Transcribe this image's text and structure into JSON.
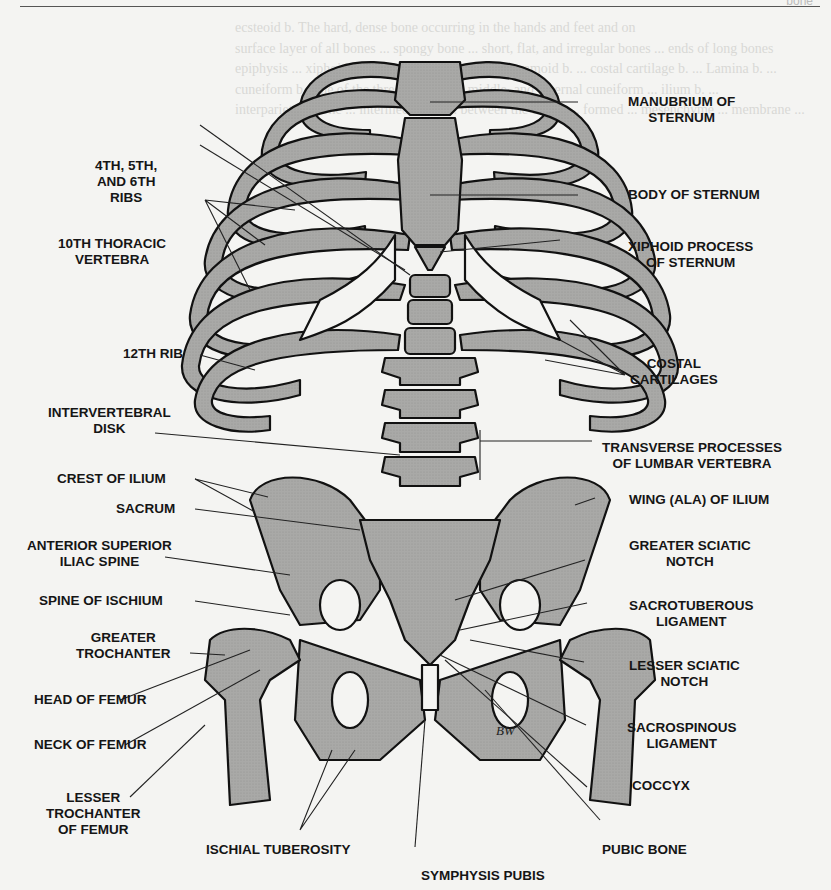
{
  "page": {
    "header_tag": "bone",
    "background_text": "ecsteoid b. The hard, dense bone occurring in the hands and feet and on\nsurface layer of all bones ... spongy bone ... short, flat, and irregular bones ... ends of long bones\nepiphysis ... xiphoid b. ... cuboid b. The outer ... sesamoid b. ... costal cartilage b. ... Lamina b. ...\ncuneiform b. One of the three ... internal, middle, and external cuneiform ... ilium b. ...\ninterparietal b. The ... intermediate b. ... between the center ... formed ... mesenchyme ... membrane ..."
  },
  "diagram": {
    "fill_color": "#a9a9a7",
    "cartilage_color": "#f4f4f2",
    "outline_color": "#111111",
    "signature": "BW",
    "labels_left": [
      {
        "id": "ribs-4-5-6",
        "lines": [
          "4TH, 5TH,",
          "AND 6TH",
          "RIBS"
        ]
      },
      {
        "id": "10th-thoracic-vertebra",
        "lines": [
          "10TH THORACIC",
          "VERTEBRA"
        ]
      },
      {
        "id": "12th-rib",
        "lines": [
          "12TH RIB"
        ]
      },
      {
        "id": "intervertebral-disk",
        "lines": [
          "INTERVERTEBRAL",
          "DISK"
        ]
      },
      {
        "id": "crest-of-ilium",
        "lines": [
          "CREST OF ILIUM"
        ]
      },
      {
        "id": "sacrum",
        "lines": [
          "SACRUM"
        ]
      },
      {
        "id": "anterior-superior-iliac-spine",
        "lines": [
          "ANTERIOR SUPERIOR",
          "ILIAC SPINE"
        ]
      },
      {
        "id": "spine-of-ischium",
        "lines": [
          "SPINE OF ISCHIUM"
        ]
      },
      {
        "id": "greater-trochanter",
        "lines": [
          "GREATER",
          "TROCHANTER"
        ]
      },
      {
        "id": "head-of-femur",
        "lines": [
          "HEAD OF FEMUR"
        ]
      },
      {
        "id": "neck-of-femur",
        "lines": [
          "NECK OF FEMUR"
        ]
      },
      {
        "id": "lesser-trochanter-of-femur",
        "lines": [
          "LESSER",
          "TROCHANTER",
          "OF FEMUR"
        ]
      }
    ],
    "labels_right": [
      {
        "id": "manubrium-of-sternum",
        "lines": [
          "MANUBRIUM OF",
          "STERNUM"
        ]
      },
      {
        "id": "body-of-sternum",
        "lines": [
          "BODY OF STERNUM"
        ]
      },
      {
        "id": "xiphoid-process",
        "lines": [
          "XIPHOID PROCESS",
          "OF STERNUM"
        ]
      },
      {
        "id": "costal-cartilages",
        "lines": [
          "COSTAL",
          "CARTILAGES"
        ]
      },
      {
        "id": "transverse-processes",
        "lines": [
          "TRANSVERSE PROCESSES",
          "OF LUMBAR VERTEBRA"
        ]
      },
      {
        "id": "wing-of-ilium",
        "lines": [
          "WING (ALA) OF ILIUM"
        ]
      },
      {
        "id": "greater-sciatic-notch",
        "lines": [
          "GREATER SCIATIC",
          "NOTCH"
        ]
      },
      {
        "id": "sacrotuberous-ligament",
        "lines": [
          "SACROTUBEROUS",
          "LIGAMENT"
        ]
      },
      {
        "id": "lesser-sciatic-notch",
        "lines": [
          "LESSER SCIATIC",
          "NOTCH"
        ]
      },
      {
        "id": "sacrospinous-ligament",
        "lines": [
          "SACROSPINOUS",
          "LIGAMENT"
        ]
      },
      {
        "id": "coccyx",
        "lines": [
          "COCCYX"
        ]
      },
      {
        "id": "pubic-bone",
        "lines": [
          "PUBIC BONE"
        ]
      }
    ],
    "labels_bottom": [
      {
        "id": "ischial-tuberosity",
        "lines": [
          "ISCHIAL TUBEROSITY"
        ]
      },
      {
        "id": "symphysis-pubis",
        "lines": [
          "SYMPHYSIS PUBIS"
        ]
      }
    ]
  }
}
